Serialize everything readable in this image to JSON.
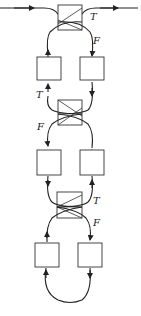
{
  "diagram": {
    "type": "switch-chain",
    "colors": {
      "stroke": "#222222",
      "background": "#ffffff"
    },
    "switches": [
      {
        "id": "switch-1",
        "true_label": "T",
        "false_label": "F"
      },
      {
        "id": "switch-2",
        "true_label": "T",
        "false_label": "F"
      },
      {
        "id": "switch-3",
        "true_label": "T",
        "false_label": "F"
      }
    ],
    "box_rows": [
      {
        "row": 1,
        "boxes": [
          "left",
          "right"
        ]
      },
      {
        "row": 2,
        "boxes": [
          "left",
          "right"
        ]
      },
      {
        "row": 3,
        "boxes": [
          "left",
          "right"
        ]
      }
    ]
  },
  "labels": {
    "s1_t": "T",
    "s1_f": "F",
    "s2_t": "T",
    "s2_f": "F",
    "s3_t": "T",
    "s3_f": "F"
  }
}
